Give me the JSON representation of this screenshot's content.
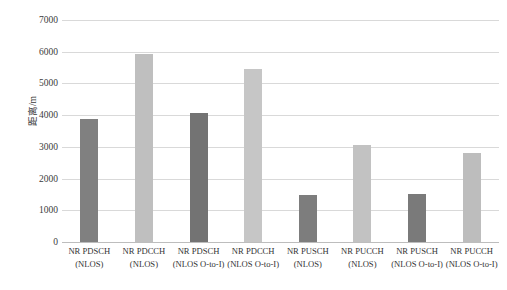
{
  "chart_data": {
    "type": "bar",
    "title": "",
    "subtitle": "",
    "xlabel": "",
    "ylabel": "距离/m",
    "ylim": [
      0,
      7000
    ],
    "ytick_labels": [
      "7000",
      "6000",
      "5000",
      "4000",
      "3000",
      "2000",
      "1000",
      "0"
    ],
    "yticks": [
      7000,
      6000,
      5000,
      4000,
      3000,
      2000,
      1000,
      0
    ],
    "grid": true,
    "legend": "none",
    "categories": [
      "NR PDSCH (NLOS)",
      "NR PDCCH (NLOS)",
      "NR PDSCH (NLOS O-to-I)",
      "NR PDCCH (NLOS O-to-I)",
      "NR PUSCH (NLOS)",
      "NR PUCCH (NLOS)",
      "NR PUSCH (NLOS O-to-I)",
      "NR PUCCH (NLOS O-to-I)"
    ],
    "category_lines": [
      {
        "line1": "NR PDSCH",
        "line2": "(NLOS)"
      },
      {
        "line1": "NR PDCCH",
        "line2": "(NLOS)"
      },
      {
        "line1": "NR PDSCH",
        "line2": "(NLOS O-to-I)"
      },
      {
        "line1": "NR PDCCH",
        "line2": "(NLOS O-to-I)"
      },
      {
        "line1": "NR PUSCH",
        "line2": "(NLOS)"
      },
      {
        "line1": "NR PUCCH",
        "line2": "(NLOS)"
      },
      {
        "line1": "NR PUSCH",
        "line2": "(NLOS O-to-I)"
      },
      {
        "line1": "NR PUCCH",
        "line2": "(NLOS O-to-I)"
      }
    ],
    "values": [
      3880,
      5930,
      4080,
      5460,
      1480,
      3060,
      1520,
      2820
    ],
    "bar_colors": [
      "#808080",
      "#bfbfbf",
      "#737373",
      "#c6c6c6",
      "#7d7d7d",
      "#c2c2c2",
      "#7a7a7a",
      "#bdbdbd"
    ]
  },
  "colors": {
    "gridline": "#d9d9d9",
    "baseline": "#bdbdbd",
    "text": "#333333",
    "dark_series": "#808080",
    "light_series": "#bfbfbf"
  }
}
